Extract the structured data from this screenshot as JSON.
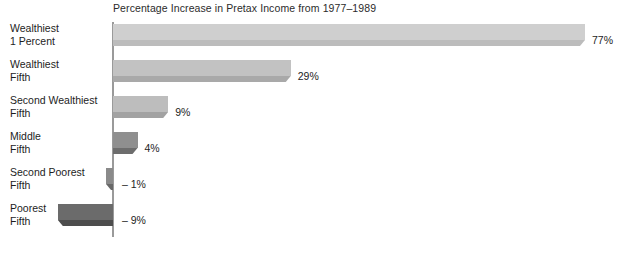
{
  "chart_data": {
    "type": "bar",
    "title": "Percentage Increase in Pretax Income from 1977–1989",
    "orientation": "horizontal",
    "xlabel": "",
    "ylabel": "",
    "grid": false,
    "legend": false,
    "xlim": [
      -9,
      77
    ],
    "categories": [
      "Wealthiest 1 Percent",
      "Wealthiest Fifth",
      "Second Wealthiest Fifth",
      "Middle Fifth",
      "Second Poorest Fifth",
      "Poorest Fifth"
    ],
    "values": [
      77,
      29,
      9,
      4,
      -1,
      -9
    ],
    "value_labels": [
      "77%",
      "29%",
      "9%",
      "4%",
      "– 1%",
      "– 9%"
    ],
    "bars": [
      {
        "label_line1": "Wealthiest",
        "label_line2": "1 Percent",
        "value": 77,
        "value_label": "77%",
        "face_color": "#cfcfcf",
        "base_color": "#bcbcbc"
      },
      {
        "label_line1": "Wealthiest",
        "label_line2": "Fifth",
        "value": 29,
        "value_label": "29%",
        "face_color": "#c2c2c2",
        "base_color": "#a9a9a9"
      },
      {
        "label_line1": "Second Wealthiest",
        "label_line2": "Fifth",
        "value": 9,
        "value_label": "9%",
        "face_color": "#bdbdbd",
        "base_color": "#a2a2a2"
      },
      {
        "label_line1": "Middle",
        "label_line2": "Fifth",
        "value": 4,
        "value_label": "4%",
        "face_color": "#8f8f8f",
        "base_color": "#6d6d6d"
      },
      {
        "label_line1": "Second Poorest",
        "label_line2": "Fifth",
        "value": -1,
        "value_label": "– 1%",
        "face_color": "#8a8a8a",
        "base_color": "#686868"
      },
      {
        "label_line1": "Poorest",
        "label_line2": "Fifth",
        "value": -9,
        "value_label": "– 9%",
        "face_color": "#6b6b6b",
        "base_color": "#4d4d4d"
      }
    ],
    "axis_color": "#9a9a9a",
    "text_color": "#1d1d1d",
    "background": "#ffffff"
  }
}
